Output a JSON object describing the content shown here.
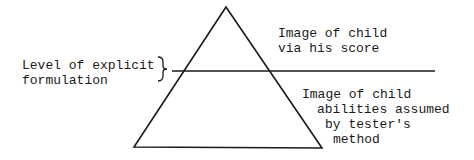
{
  "diagram": {
    "type": "pyramid-with-threshold-line",
    "colors": {
      "stroke": "#1a1a1a",
      "background": "#ffffff"
    },
    "triangle": {
      "apex": [
        226,
        7
      ],
      "bottom_left": [
        134,
        147
      ],
      "bottom_right": [
        322,
        148
      ]
    },
    "threshold_line": {
      "x1": 172,
      "y1": 71,
      "x2": 435,
      "y2": 71
    },
    "labels": {
      "level": {
        "lines": [
          "Level of explicit",
          "formulation"
        ]
      },
      "score": {
        "lines": [
          "Image of child",
          "via his score"
        ]
      },
      "assumed": {
        "lines": [
          "Image of child",
          "abilities assumed",
          "by tester's",
          "method"
        ]
      }
    },
    "brace": {
      "x": 160,
      "y_top": 57,
      "y_bottom": 81
    }
  }
}
